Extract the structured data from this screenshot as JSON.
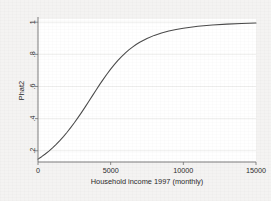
{
  "figure": {
    "background_color": "#f4f3f2",
    "plot_background_color": "#ffffff",
    "curve_color": "#4a4a4a",
    "grid_color": "#e3e2e1",
    "axis_color": "#6e6e6e"
  },
  "chart_data": {
    "type": "line",
    "title": "",
    "subtitle": "",
    "xlabel": "Household income 1997 (monthly)",
    "ylabel": "Phat2",
    "xlim": [
      0,
      15000
    ],
    "ylim": [
      0.13,
      1.02
    ],
    "xticks": [
      0,
      5000,
      10000,
      15000
    ],
    "xtick_labels": [
      "0",
      "5000",
      "10000",
      "15000"
    ],
    "yticks": [
      0.2,
      0.4,
      0.6,
      0.8,
      1
    ],
    "ytick_labels": [
      ".2",
      ".4",
      ".6",
      ".8",
      "1"
    ],
    "grid": "horizontal",
    "legend": "none",
    "annotations": [],
    "series": [
      {
        "name": "Phat2",
        "color": "#4a4a4a",
        "x": [
          0,
          250,
          500,
          750,
          1000,
          1250,
          1500,
          1750,
          2000,
          2250,
          2500,
          2750,
          3000,
          3250,
          3500,
          3750,
          4000,
          4250,
          4500,
          4750,
          5000,
          5250,
          5500,
          5750,
          6000,
          6250,
          6500,
          6750,
          7000,
          7500,
          8000,
          8500,
          9000,
          9500,
          10000,
          11000,
          12000,
          13000,
          14000,
          15000
        ],
        "y": [
          0.148,
          0.163,
          0.18,
          0.198,
          0.218,
          0.24,
          0.263,
          0.288,
          0.315,
          0.344,
          0.374,
          0.406,
          0.439,
          0.473,
          0.508,
          0.543,
          0.578,
          0.613,
          0.646,
          0.678,
          0.708,
          0.736,
          0.762,
          0.786,
          0.808,
          0.828,
          0.845,
          0.861,
          0.875,
          0.899,
          0.918,
          0.933,
          0.945,
          0.955,
          0.963,
          0.975,
          0.983,
          0.988,
          0.992,
          0.995
        ]
      }
    ]
  }
}
